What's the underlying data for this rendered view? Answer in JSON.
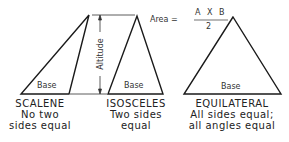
{
  "formula": {
    "prefix": "Area =",
    "numerator": "A X B",
    "denominator": "2"
  },
  "dimension_label": "Altitude",
  "triangles": [
    {
      "name": "SCALENE",
      "line1": "No two",
      "line2": "sides equal",
      "base_label": "Base"
    },
    {
      "name": "ISOSCELES",
      "line1": "Two sides",
      "line2": "equal",
      "base_label": "Base"
    },
    {
      "name": "EQUILATERAL",
      "line1": "All sides equal;",
      "line2": "all angles equal",
      "base_label": "Base"
    }
  ]
}
